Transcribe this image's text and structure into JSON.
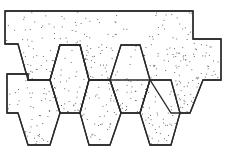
{
  "figure": {
    "stroke_color": "#2a2a2a",
    "stipple_color": "#4a4a4a",
    "background": "#ffffff"
  },
  "shapes": [
    {
      "name": "top-strip",
      "points": "5,11 193,11 193,39 221,39 221,80 203,80 190,113 171,113 150,80 121,80 110,80 89,80 80,45 60,45 50,80 28,80 18,44 5,44",
      "density": 0.11
    },
    {
      "name": "hex-upper-1",
      "points": "60,45 80,45 89,80 80,113 60,113 50,80",
      "density": 0.07
    },
    {
      "name": "hex-upper-2",
      "points": "121,45 140,45 150,80 140,113 121,113 110,80",
      "density": 0.07
    },
    {
      "name": "left-lower-block",
      "points": "7,74 28,74 28,80 50,80 60,113 50,145 28,145 18,113 7,113",
      "density": 0.09
    },
    {
      "name": "hex-lower-1",
      "points": "89,80 110,80 121,113 110,145 89,145 80,113",
      "density": 0.1
    },
    {
      "name": "hex-lower-2",
      "points": "150,80 171,80 180,113 171,145 150,145 140,113",
      "density": 0.1
    }
  ]
}
